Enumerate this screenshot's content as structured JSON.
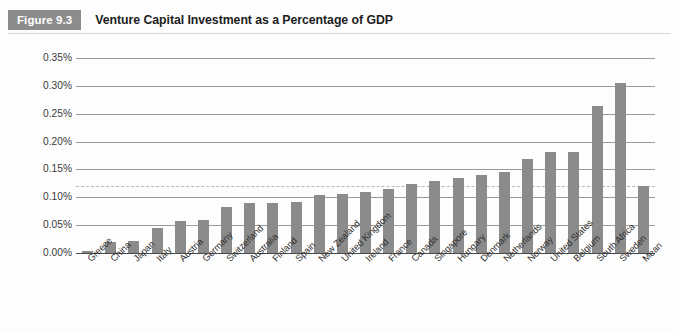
{
  "header": {
    "badge": "Figure 9.3",
    "title": "Venture Capital Investment as a Percentage of GDP"
  },
  "chart_data": {
    "type": "bar",
    "title": "Venture Capital Investment as a Percentage of GDP",
    "xlabel": "",
    "ylabel": "",
    "ylim": [
      0,
      0.35
    ],
    "ytick_values": [
      0.35,
      0.3,
      0.25,
      0.2,
      0.15,
      0.1,
      0.05,
      0.0
    ],
    "ytick_labels": [
      "0.35%",
      "0.30%",
      "0.25%",
      "0.20%",
      "0.15%",
      "0.10%",
      "0.05%",
      "0.00%"
    ],
    "grid": true,
    "legend": "none",
    "bar_color": "#8b8b8b",
    "gridline_color": "#9a9a9a",
    "reference_line": {
      "label": "Mean",
      "value": 0.121,
      "style": "dashed",
      "color": "#b9b9b9"
    },
    "categories": [
      "Greece",
      "China",
      "Japan",
      "Italy",
      "Austria",
      "Germany",
      "Switzerland",
      "Australia",
      "Finland",
      "Spain",
      "New Zealand",
      "United Kingdom",
      "Ireland",
      "France",
      "Canada",
      "Singapore",
      "Hungary",
      "Denmark",
      "Netherlands",
      "Norway",
      "United States",
      "Belgium",
      "South Africa",
      "Sweden",
      "Mean"
    ],
    "values": [
      0.003,
      0.019,
      0.022,
      0.045,
      0.057,
      0.059,
      0.082,
      0.089,
      0.09,
      0.091,
      0.104,
      0.106,
      0.11,
      0.115,
      0.124,
      0.129,
      0.135,
      0.14,
      0.146,
      0.169,
      0.181,
      0.182,
      0.264,
      0.305,
      0.121
    ],
    "value_labels": [
      "0.003%",
      "0.019%",
      "0.022%",
      "0.045%",
      "0.057%",
      "0.059%",
      "0.082%",
      "0.089%",
      "0.090%",
      "0.091%",
      "0.104%",
      "0.106%",
      "0.110%",
      "0.115%",
      "0.124%",
      "0.129%",
      "0.135%",
      "0.140%",
      "0.146%",
      "0.169%",
      "0.181%",
      "0.182%",
      "0.264%",
      "0.305%",
      "0.121%"
    ]
  }
}
